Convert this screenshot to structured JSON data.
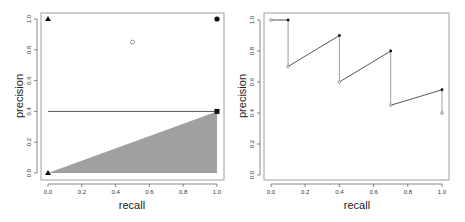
{
  "chart_data": [
    {
      "type": "scatter",
      "panel": "left",
      "title": "",
      "xlabel": "recall",
      "ylabel": "precision",
      "xlim": [
        0,
        1
      ],
      "ylim": [
        0,
        1
      ],
      "xticks": [
        "0.0",
        "0.2",
        "0.4",
        "0.6",
        "0.8",
        "1.0"
      ],
      "yticks": [
        "0.0",
        "0.2",
        "0.4",
        "0.6",
        "0.8",
        "1.0"
      ],
      "grid": false,
      "points": [
        {
          "x": 0.0,
          "y": 1.0,
          "marker": "filled-triangle"
        },
        {
          "x": 1.0,
          "y": 1.0,
          "marker": "filled-circle"
        },
        {
          "x": 0.5,
          "y": 0.85,
          "marker": "open-circle"
        },
        {
          "x": 1.0,
          "y": 0.4,
          "marker": "filled-square"
        },
        {
          "x": 0.0,
          "y": 0.0,
          "marker": "filled-triangle"
        }
      ],
      "lines": [
        {
          "name": "baseline",
          "from": [
            0.0,
            0.4
          ],
          "to": [
            1.0,
            0.4
          ],
          "color": "#555555"
        }
      ],
      "shaded_area": {
        "vertices": [
          [
            0.0,
            0.0
          ],
          [
            1.0,
            0.4
          ],
          [
            1.0,
            0.0
          ]
        ],
        "color": "#a0a0a0"
      }
    },
    {
      "type": "line",
      "panel": "right",
      "title": "",
      "xlabel": "recall",
      "ylabel": "precision",
      "xlim": [
        0,
        1
      ],
      "ylim": [
        0,
        1
      ],
      "xticks": [
        "0.0",
        "0.2",
        "0.4",
        "0.6",
        "0.8",
        "1.0"
      ],
      "yticks": [
        "0.0",
        "0.2",
        "0.4",
        "0.6",
        "0.8",
        "1.0"
      ],
      "grid": false,
      "series": [
        {
          "name": "precision-recall sawtooth",
          "x": [
            0.0,
            0.1,
            0.1,
            0.4,
            0.4,
            0.7,
            0.7,
            1.0,
            1.0
          ],
          "y": [
            1.0,
            1.0,
            0.7,
            0.9,
            0.6,
            0.8,
            0.45,
            0.55,
            0.4
          ],
          "markers": [
            "open",
            "filled",
            "open",
            "filled",
            "open",
            "filled",
            "open",
            "filled",
            "open"
          ]
        }
      ]
    }
  ],
  "labels": {
    "left_xlabel": "recall",
    "left_ylabel": "precision",
    "right_xlabel": "recall",
    "right_ylabel": "precision"
  },
  "colors": {
    "axis": "#555555",
    "frame": "#888888",
    "fill": "#a0a0a0",
    "line": "#444444",
    "marker": "#111111"
  }
}
